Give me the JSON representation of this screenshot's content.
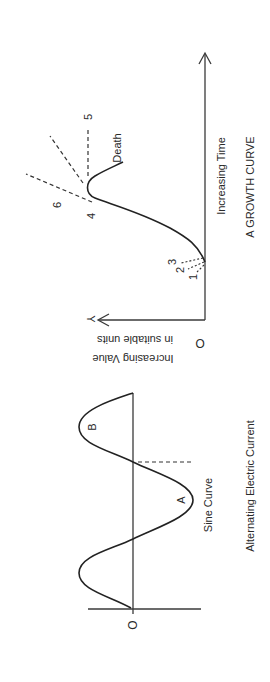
{
  "growth_curve": {
    "title": "A GROWTH CURVE",
    "x_axis_label": "Increasing Time",
    "y_axis_label_line1": "Increasing Value",
    "y_axis_label_line2": "in suitable units",
    "y_axis_letter": "Y",
    "origin_label": "O",
    "death_label": "Death",
    "point_labels": [
      "1",
      "2",
      "3",
      "4",
      "5",
      "6"
    ]
  },
  "sine_curve": {
    "title": "Alternating Electric Current",
    "curve_label": "Sine Curve",
    "origin_label": "O",
    "peak_label_a": "A",
    "peak_label_b": "B"
  },
  "colors": {
    "line": "#222222",
    "background": "#ffffff"
  }
}
